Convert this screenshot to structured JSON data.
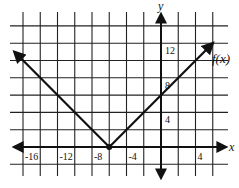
{
  "chart_data": {
    "type": "line",
    "title": "",
    "function_label": "f(x)",
    "xlabel": "x",
    "ylabel": "y",
    "xlim": [
      -16,
      6
    ],
    "ylim": [
      -2,
      14
    ],
    "grid": true,
    "grid_step": 2,
    "x_tick_labels": [
      {
        "value": -16,
        "label": "-16"
      },
      {
        "value": -12,
        "label": "-12"
      },
      {
        "value": -8,
        "label": "-8"
      },
      {
        "value": -4,
        "label": "-4"
      },
      {
        "value": 4,
        "label": "4"
      }
    ],
    "y_tick_labels": [
      {
        "value": 12,
        "label": "12"
      },
      {
        "value": 8,
        "label": "8"
      },
      {
        "value": 4,
        "label": "4"
      }
    ],
    "series": [
      {
        "name": "f(x)",
        "kind": "absolute-value",
        "vertex": [
          -6,
          0
        ],
        "points": [
          [
            -17,
            11
          ],
          [
            -6,
            0
          ],
          [
            6,
            12
          ]
        ],
        "arrows_both_ends": true
      }
    ],
    "annotations": [
      {
        "type": "point",
        "at": [
          -6,
          0
        ],
        "style": "filled-dot"
      }
    ]
  }
}
